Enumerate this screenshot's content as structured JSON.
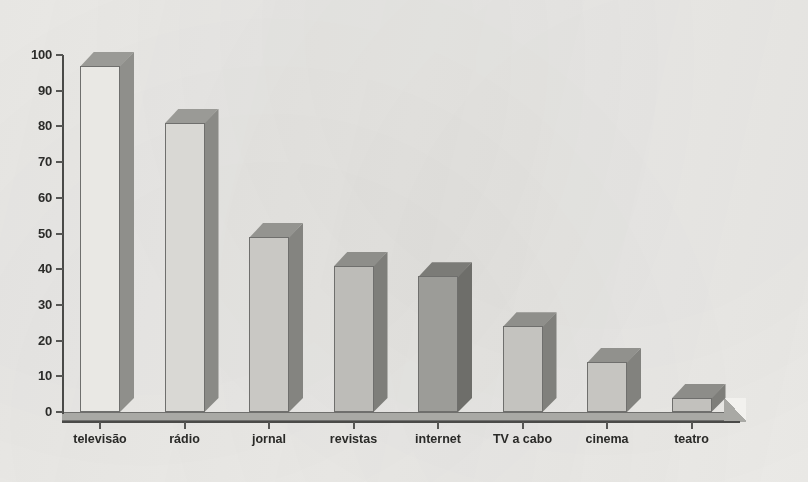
{
  "chart_data": {
    "type": "bar",
    "title": "",
    "subtitle": "",
    "xlabel": "",
    "ylabel": "",
    "categories": [
      "televisão",
      "rádio",
      "jornal",
      "revistas",
      "internet",
      "TV a cabo",
      "cinema",
      "teatro"
    ],
    "values": [
      97,
      81,
      49,
      41,
      38,
      24,
      14,
      4
    ],
    "ylim": [
      0,
      100
    ],
    "ytick_labels": [
      "0",
      "10",
      "20",
      "30",
      "40",
      "50",
      "60",
      "70",
      "80",
      "90",
      "100"
    ],
    "ytick_values": [
      0,
      10,
      20,
      30,
      40,
      50,
      60,
      70,
      80,
      90,
      100
    ],
    "grid": false,
    "legend": "none",
    "style": "3d-bars-grayscale-scan",
    "bar_colors": [
      {
        "name": "televisão",
        "front": "#e9e8e4",
        "top": "#9a9a96",
        "side": "#8f8f8b"
      },
      {
        "name": "rádio",
        "front": "#d9d8d4",
        "top": "#9a9a96",
        "side": "#8a8a86"
      },
      {
        "name": "jornal",
        "front": "#c9c8c4",
        "top": "#949490",
        "side": "#848480"
      },
      {
        "name": "revistas",
        "front": "#bdbcb8",
        "top": "#8e8e8a",
        "side": "#7e7e7a"
      },
      {
        "name": "internet",
        "front": "#9c9c98",
        "top": "#7b7b77",
        "side": "#6e6e6a"
      },
      {
        "name": "TV a cabo",
        "front": "#c4c3bf",
        "top": "#8f8f8b",
        "side": "#80807c"
      },
      {
        "name": "cinema",
        "front": "#c6c5c1",
        "top": "#91918d",
        "side": "#82827e"
      },
      {
        "name": "teatro",
        "front": "#c2c1bd",
        "top": "#8d8d89",
        "side": "#7e7e7a"
      }
    ],
    "axis_color": "#4a4a48",
    "background_color": "#f2f1ee"
  }
}
